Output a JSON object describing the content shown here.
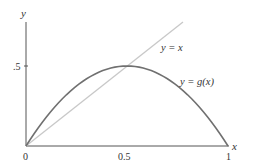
{
  "chart_data": {
    "type": "line",
    "title": "",
    "xlabel": "x",
    "ylabel": "y",
    "xlim": [
      0,
      1
    ],
    "ylim": [
      0,
      0.78
    ],
    "grid": false,
    "x_ticks": [
      "0",
      "0.5",
      "1"
    ],
    "y_ticks": [
      ".5"
    ],
    "series": [
      {
        "name": "y = x",
        "function": "x",
        "color": "#c8c8c8",
        "x": [
          0,
          0.25,
          0.5,
          0.75,
          0.77
        ],
        "y": [
          0,
          0.25,
          0.5,
          0.75,
          0.77
        ]
      },
      {
        "name": "y = g(x)",
        "function": "2x(1-x)",
        "color": "#707070",
        "x": [
          0,
          0.1,
          0.2,
          0.3,
          0.4,
          0.5,
          0.6,
          0.7,
          0.8,
          0.9,
          1.0
        ],
        "y": [
          0,
          0.18,
          0.32,
          0.42,
          0.48,
          0.5,
          0.48,
          0.42,
          0.32,
          0.18,
          0
        ]
      }
    ],
    "annotations": [
      {
        "text": "y = x",
        "x": 0.78,
        "y": 0.64
      },
      {
        "text": "y = g(x)",
        "x": 0.87,
        "y": 0.41
      }
    ]
  },
  "labels": {
    "y_axis": "y",
    "x_axis": "x",
    "tick_x0": "0",
    "tick_x_half": "0.5",
    "tick_x1": "1",
    "tick_y_half": ".5",
    "line_label": "y = x",
    "curve_label": "y = g(x)"
  }
}
